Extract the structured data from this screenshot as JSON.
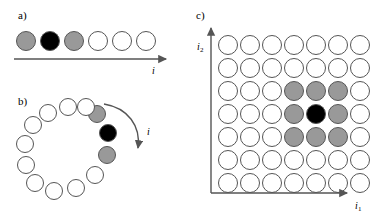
{
  "figure": {
    "width": 390,
    "height": 221,
    "background": "#ffffff"
  },
  "colors": {
    "center": "#000000",
    "neighbor": "#999999",
    "empty": "#ffffff",
    "outline": "#555555",
    "axis": "#555555",
    "text": "#000000"
  },
  "panels": {
    "a": {
      "label": "a)",
      "label_x": 18,
      "label_y": 10,
      "axis_label": "i",
      "axis_label_x": 152,
      "axis_label_y": 66,
      "arrow": {
        "x1": 14,
        "y1": 59,
        "x2": 166,
        "y2": 59
      },
      "radius": 10,
      "cy": 41,
      "nodes": [
        {
          "cx": 26,
          "fill": "#999999",
          "state": "neighbor"
        },
        {
          "cx": 50,
          "fill": "#000000",
          "state": "center"
        },
        {
          "cx": 74,
          "fill": "#999999",
          "state": "neighbor"
        },
        {
          "cx": 98,
          "fill": "#ffffff",
          "state": "empty"
        },
        {
          "cx": 122,
          "fill": "#ffffff",
          "state": "empty"
        },
        {
          "cx": 146,
          "fill": "#ffffff",
          "state": "empty"
        }
      ]
    },
    "b": {
      "label": "b)",
      "label_x": 18,
      "label_y": 96,
      "axis_label": "i",
      "axis_label_x": 147,
      "axis_label_y": 127,
      "radius": 9,
      "nodes": [
        {
          "cx": 97,
          "cy": 114,
          "fill": "#999999",
          "state": "neighbor"
        },
        {
          "cx": 108,
          "cy": 133,
          "fill": "#000000",
          "state": "center"
        },
        {
          "cx": 107,
          "cy": 155,
          "fill": "#999999",
          "state": "neighbor"
        },
        {
          "cx": 95,
          "cy": 175,
          "fill": "#ffffff",
          "state": "empty"
        },
        {
          "cx": 76,
          "cy": 188,
          "fill": "#ffffff",
          "state": "empty"
        },
        {
          "cx": 54,
          "cy": 191,
          "fill": "#ffffff",
          "state": "empty"
        },
        {
          "cx": 35,
          "cy": 183,
          "fill": "#ffffff",
          "state": "empty"
        },
        {
          "cx": 26,
          "cy": 165,
          "fill": "#ffffff",
          "state": "empty"
        },
        {
          "cx": 25,
          "cy": 144,
          "fill": "#ffffff",
          "state": "empty"
        },
        {
          "cx": 33,
          "cy": 125,
          "fill": "#ffffff",
          "state": "empty"
        },
        {
          "cx": 48,
          "cy": 113,
          "fill": "#ffffff",
          "state": "empty"
        },
        {
          "cx": 68,
          "cy": 107,
          "fill": "#ffffff",
          "state": "empty"
        },
        {
          "cx": 86,
          "cy": 107,
          "fill": "#ffffff",
          "state": "empty"
        }
      ]
    },
    "c": {
      "label": "c)",
      "label_x": 196,
      "label_y": 10,
      "x_axis_label": "i",
      "x_axis_sub": "1",
      "x_axis_label_x": 355,
      "x_axis_label_y": 201,
      "y_axis_label": "i",
      "y_axis_sub": "2",
      "y_axis_label_x": 197,
      "y_axis_label_y": 42,
      "axes": {
        "origin_x": 211,
        "origin_y": 193,
        "x_end": 347,
        "y_end": 28
      },
      "radius": 10,
      "col_x": [
        228,
        250,
        272,
        294,
        316,
        338,
        360
      ],
      "row_y": [
        45,
        68,
        91,
        114,
        137,
        160,
        183
      ],
      "grid": [
        [
          "empty",
          "empty",
          "empty",
          "empty",
          "empty",
          "empty",
          "empty"
        ],
        [
          "empty",
          "empty",
          "empty",
          "empty",
          "empty",
          "empty",
          "empty"
        ],
        [
          "empty",
          "empty",
          "empty",
          "neighbor",
          "neighbor",
          "neighbor",
          "empty"
        ],
        [
          "empty",
          "empty",
          "empty",
          "neighbor",
          "center",
          "neighbor",
          "empty"
        ],
        [
          "empty",
          "empty",
          "empty",
          "neighbor",
          "neighbor",
          "neighbor",
          "empty"
        ],
        [
          "empty",
          "empty",
          "empty",
          "empty",
          "empty",
          "empty",
          "empty"
        ],
        [
          "empty",
          "empty",
          "empty",
          "empty",
          "empty",
          "empty",
          "empty"
        ]
      ]
    }
  }
}
